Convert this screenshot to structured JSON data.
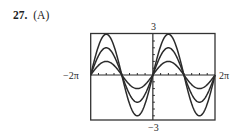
{
  "problem": {
    "number": "27.",
    "choice": "(A)"
  },
  "chart_data": {
    "type": "line",
    "title": "",
    "xlabel": "",
    "ylabel": "",
    "xlim": [
      -6.2832,
      6.2832
    ],
    "ylim": [
      -3,
      3
    ],
    "x_tick_labels": {
      "min": "−2π",
      "max": "2π"
    },
    "y_tick_labels": {
      "max": "3",
      "min": "−3"
    },
    "x_tick_step": 0.7854,
    "y_tick_step": 0.5,
    "grid": false,
    "legend": null,
    "series": [
      {
        "name": "y = sin x",
        "amplitude": 1,
        "function": "1*sin(x)"
      },
      {
        "name": "y = 2 sin x",
        "amplitude": 2,
        "function": "2*sin(x)"
      },
      {
        "name": "y = 3 sin x",
        "amplitude": 3,
        "function": "3*sin(x)"
      }
    ]
  },
  "labels": {
    "ymax": "3",
    "ymin": "−3",
    "xmin": "−2π",
    "xmax": "2π"
  },
  "style": {
    "curve_color": "#2b2b2b",
    "axis_color": "#2b2b2b",
    "frame_color": "#333333"
  }
}
